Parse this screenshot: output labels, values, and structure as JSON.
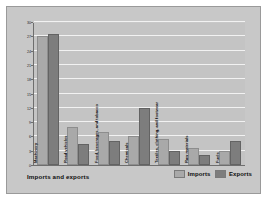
{
  "figure": {
    "background_color": "#c8c8c8",
    "plot_background_color": "#c4c4c4"
  },
  "title": "Imports and exports",
  "legend": {
    "position": "bottom-right",
    "entries": [
      {
        "label": "Imports",
        "color": "#a9a9a9",
        "swatch_name": "imports-swatch"
      },
      {
        "label": "Exports",
        "color": "#7d7d7d",
        "swatch_name": "exports-swatch"
      }
    ]
  },
  "chart_data": {
    "type": "bar",
    "title": "Imports and exports",
    "xlabel": "",
    "ylabel": "Percentage of total",
    "ylim": [
      0,
      30
    ],
    "ytick_step": 3,
    "yticks": [
      0,
      3,
      6,
      9,
      12,
      15,
      18,
      21,
      24,
      27,
      30
    ],
    "ytick_labels": [
      "0",
      "3",
      "6",
      "9",
      "12",
      "15",
      "18",
      "21",
      "24",
      "27",
      "30"
    ],
    "grid": true,
    "grid_axis": "y",
    "legend_position": "bottom-right",
    "categories": [
      "Machinery",
      "Road vehicles",
      "Food, beverages, and tobacco",
      "Chemicals",
      "Textiles, clothing, and footwear",
      "Raw materials",
      "Fuels"
    ],
    "series": [
      {
        "name": "Imports",
        "color": "#a9a9a9",
        "values": [
          27.0,
          8.0,
          7.0,
          6.0,
          5.5,
          3.5,
          3.0
        ]
      },
      {
        "name": "Exports",
        "color": "#7d7d7d",
        "values": [
          27.5,
          4.5,
          5.0,
          12.0,
          3.0,
          2.0,
          5.0
        ]
      }
    ]
  }
}
